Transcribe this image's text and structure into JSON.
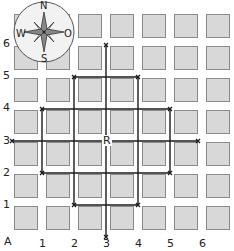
{
  "grid": {
    "columns": 7,
    "rows": 7,
    "pitch": 32,
    "origin_x": 14,
    "origin_y": 14,
    "square_size": 24,
    "square_fill": "#d8d8d8",
    "square_border": "#8a8a8a"
  },
  "axis_labels": {
    "origin": "A",
    "x": [
      "1",
      "2",
      "3",
      "4",
      "5",
      "6"
    ],
    "y": [
      "6",
      "5",
      "4",
      "3",
      "2",
      "1"
    ]
  },
  "center_label": "R",
  "compass": {
    "north": "N",
    "south": "S",
    "west": "W",
    "east": "O"
  },
  "lines": [
    {
      "name": "vertical-col-3",
      "from": [
        106,
        45
      ],
      "to": [
        106,
        237
      ]
    },
    {
      "name": "horizontal-row-3",
      "from": [
        12,
        141
      ],
      "to": [
        198,
        141
      ]
    },
    {
      "name": "rect-tall-top",
      "from": [
        74,
        77
      ],
      "to": [
        138,
        77
      ]
    },
    {
      "name": "rect-tall-bottom",
      "from": [
        74,
        205
      ],
      "to": [
        138,
        205
      ]
    },
    {
      "name": "rect-tall-left",
      "from": [
        74,
        77
      ],
      "to": [
        74,
        205
      ]
    },
    {
      "name": "rect-tall-right",
      "from": [
        138,
        77
      ],
      "to": [
        138,
        205
      ]
    },
    {
      "name": "rect-wide-top",
      "from": [
        42,
        109
      ],
      "to": [
        170,
        109
      ]
    },
    {
      "name": "rect-wide-bottom",
      "from": [
        42,
        173
      ],
      "to": [
        170,
        173
      ]
    },
    {
      "name": "rect-wide-left",
      "from": [
        42,
        109
      ],
      "to": [
        42,
        173
      ]
    },
    {
      "name": "rect-wide-right",
      "from": [
        170,
        109
      ],
      "to": [
        170,
        173
      ]
    }
  ],
  "colors": {
    "line": "#1a1a1a",
    "compass_fill": "#f2f2f2",
    "compass_stroke": "#555555"
  }
}
